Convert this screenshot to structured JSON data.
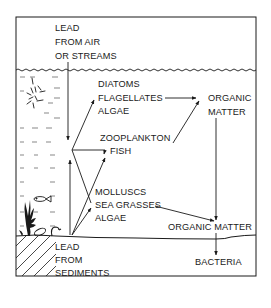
{
  "diagram": {
    "labels": {
      "source_air": [
        "LEAD",
        "FROM AIR",
        "OR STREAMS"
      ],
      "phytoplankton": [
        "DIATOMS",
        "FLAGELLATES",
        "ALGAE"
      ],
      "organic_matter_upper": [
        "ORGANIC",
        "MATTER"
      ],
      "zooplankton": "ZOOPLANKTON",
      "fish": "FISH",
      "benthic": [
        "MOLLUSCS",
        "SEA GRASSES",
        "ALGAE"
      ],
      "organic_matter_lower": "ORGANIC MATTER",
      "source_sediments": [
        "LEAD",
        "FROM",
        "SEDIMENTS"
      ],
      "bacteria": "BACTERIA"
    },
    "icons": [
      "sun-icon",
      "fish-icon",
      "seaweed-icon",
      "mollusc-icon",
      "snail-icon"
    ],
    "colors": {
      "ink": "#1a1a1a",
      "background": "#ffffff"
    }
  }
}
